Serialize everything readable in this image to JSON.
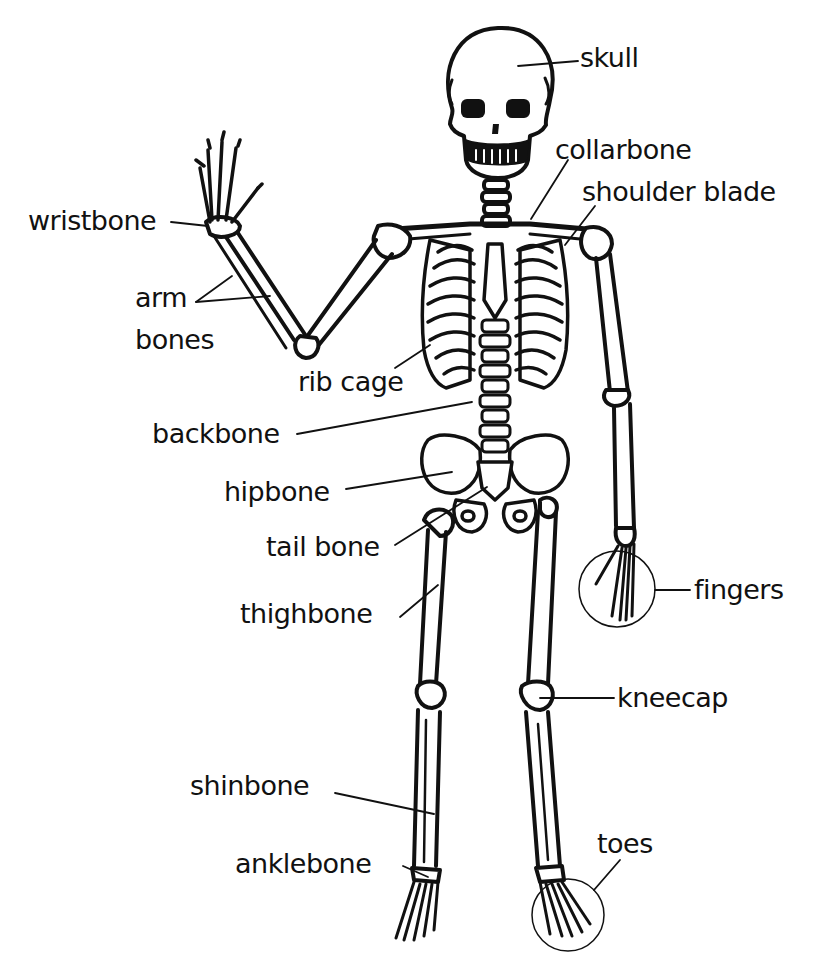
{
  "diagram": {
    "line_color": "#111111",
    "background": "#ffffff",
    "labels": [
      {
        "id": "skull",
        "text": "skull"
      },
      {
        "id": "collarbone",
        "text": "collarbone"
      },
      {
        "id": "shoulder_blade",
        "text": "shoulder blade"
      },
      {
        "id": "wristbone",
        "text": "wristbone"
      },
      {
        "id": "arm_bones_1",
        "text": "arm"
      },
      {
        "id": "arm_bones_2",
        "text": "bones"
      },
      {
        "id": "rib_cage",
        "text": "rib cage"
      },
      {
        "id": "backbone",
        "text": "backbone"
      },
      {
        "id": "hipbone",
        "text": "hipbone"
      },
      {
        "id": "tail_bone",
        "text": "tail bone"
      },
      {
        "id": "thighbone",
        "text": "thighbone"
      },
      {
        "id": "fingers",
        "text": "fingers"
      },
      {
        "id": "kneecap",
        "text": "kneecap"
      },
      {
        "id": "shinbone",
        "text": "shinbone"
      },
      {
        "id": "anklebone",
        "text": "anklebone"
      },
      {
        "id": "toes",
        "text": "toes"
      }
    ]
  }
}
